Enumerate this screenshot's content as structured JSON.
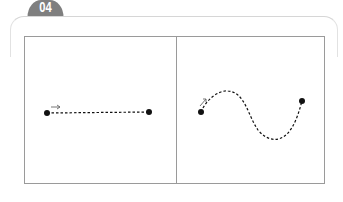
{
  "header": {
    "number_label": "04"
  },
  "colors": {
    "tab_bg": "#7f7f7f",
    "frame": "#9a9a9a",
    "outer_border": "#d6d6d6",
    "path": "#111111"
  },
  "panels": [
    {
      "name": "straight-path",
      "start_point": [
        47,
        113
      ],
      "end_point": [
        149,
        112
      ],
      "path_style": "dashed",
      "shape": "straight line",
      "direction_arrow": "right"
    },
    {
      "name": "curved-path",
      "start_point": [
        201,
        112
      ],
      "end_point": [
        302,
        101
      ],
      "path_style": "dashed",
      "shape": "S-curve",
      "direction_arrow": "up-right"
    }
  ]
}
